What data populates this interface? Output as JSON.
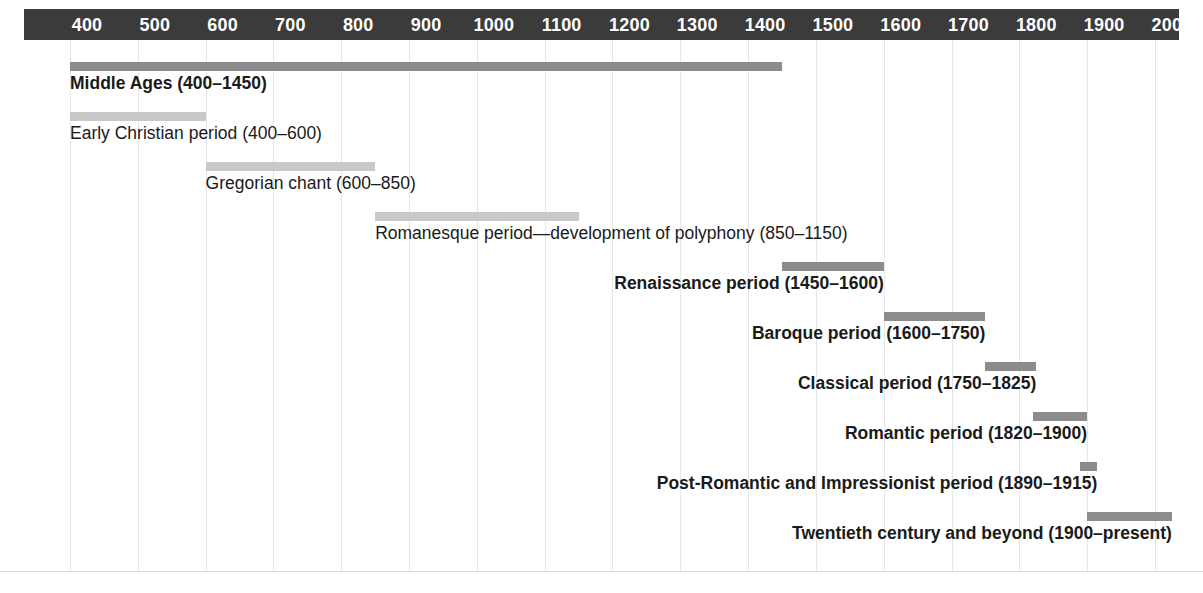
{
  "figure": {
    "kind": "music-history-timeline",
    "axis_start_year": 400,
    "axis_end_year": 2050,
    "colors": {
      "header_bg": "#3b3b3b",
      "header_text": "#ffffff",
      "bar_major": "#8c8c8c",
      "bar_minor": "#c9c9c9",
      "gridline": "#e4e6e8",
      "label_text": "#1a1a1a",
      "page_bg": "#ffffff"
    }
  },
  "axis": {
    "ticks": [
      {
        "label": "400",
        "year": 400
      },
      {
        "label": "500",
        "year": 500
      },
      {
        "label": "600",
        "year": 600
      },
      {
        "label": "700",
        "year": 700
      },
      {
        "label": "800",
        "year": 800
      },
      {
        "label": "900",
        "year": 900
      },
      {
        "label": "1000",
        "year": 1000
      },
      {
        "label": "1100",
        "year": 1100
      },
      {
        "label": "1200",
        "year": 1200
      },
      {
        "label": "1300",
        "year": 1300
      },
      {
        "label": "1400",
        "year": 1400
      },
      {
        "label": "1500",
        "year": 1500
      },
      {
        "label": "1600",
        "year": 1600
      },
      {
        "label": "1700",
        "year": 1700
      },
      {
        "label": "1800",
        "year": 1800
      },
      {
        "label": "1900",
        "year": 1900
      },
      {
        "label": "2000",
        "year": 2000
      }
    ]
  },
  "chart_data": {
    "type": "bar",
    "title": "",
    "xlabel": "",
    "ylabel": "",
    "xlim": [
      400,
      2050
    ],
    "grid": true,
    "legend": "none",
    "orientation": "horizontal-gantt",
    "categories": [
      "Middle Ages",
      "Early Christian period",
      "Gregorian chant",
      "Romanesque period—development of polyphony",
      "Renaissance period",
      "Baroque period",
      "Classical period",
      "Romantic period",
      "Post-Romantic and Impressionist period",
      "Twentieth century and beyond"
    ],
    "series": [
      {
        "name": "start",
        "values": [
          400,
          400,
          600,
          850,
          1450,
          1600,
          1750,
          1820,
          1890,
          1900
        ]
      },
      {
        "name": "end",
        "values": [
          1450,
          600,
          850,
          1150,
          1600,
          1750,
          1825,
          1900,
          1915,
          2025
        ]
      }
    ]
  },
  "rows": [
    {
      "label": "Middle Ages (400–1450)",
      "start": 400,
      "end": 1450,
      "emphasis": "major",
      "label_align": "left"
    },
    {
      "label": "Early Christian period (400–600)",
      "start": 400,
      "end": 600,
      "emphasis": "minor",
      "label_align": "left"
    },
    {
      "label": "Gregorian chant (600–850)",
      "start": 600,
      "end": 850,
      "emphasis": "minor",
      "label_align": "left"
    },
    {
      "label": "Romanesque period—development of polyphony (850–1150)",
      "start": 850,
      "end": 1150,
      "emphasis": "minor",
      "label_align": "left"
    },
    {
      "label": "Renaissance period (1450–1600)",
      "start": 1450,
      "end": 1600,
      "emphasis": "major",
      "label_align": "right"
    },
    {
      "label": "Baroque period (1600–1750)",
      "start": 1600,
      "end": 1750,
      "emphasis": "major",
      "label_align": "right"
    },
    {
      "label": "Classical period (1750–1825)",
      "start": 1750,
      "end": 1825,
      "emphasis": "major",
      "label_align": "right"
    },
    {
      "label": "Romantic period (1820–1900)",
      "start": 1820,
      "end": 1900,
      "emphasis": "major",
      "label_align": "right"
    },
    {
      "label": "Post-Romantic and Impressionist period (1890–1915)",
      "start": 1890,
      "end": 1915,
      "emphasis": "major",
      "label_align": "right"
    },
    {
      "label": "Twentieth century and beyond (1900–present)",
      "start": 1900,
      "end": 2025,
      "emphasis": "major",
      "label_align": "right"
    }
  ]
}
